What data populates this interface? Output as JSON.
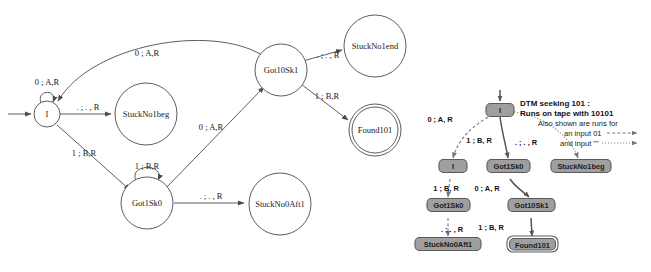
{
  "figure": {
    "background": "#ffffff"
  },
  "fsm": {
    "states": [
      {
        "id": "I",
        "label": "I",
        "cx": 47,
        "cy": 114,
        "r": 13,
        "accepting": false,
        "start": true
      },
      {
        "id": "StuckNo1beg",
        "label": "StuckNo1beg",
        "cx": 146,
        "cy": 114,
        "r": 31,
        "accepting": false,
        "start": false
      },
      {
        "id": "Got10Sk1",
        "label": "Got10Sk1",
        "cx": 281,
        "cy": 70,
        "r": 26,
        "accepting": false,
        "start": false
      },
      {
        "id": "StuckNo1end",
        "label": "StuckNo1end",
        "cx": 375,
        "cy": 46,
        "r": 31,
        "accepting": false,
        "start": false
      },
      {
        "id": "Found101",
        "label": "Found101",
        "cx": 375,
        "cy": 130,
        "r": 26,
        "accepting": true,
        "start": false
      },
      {
        "id": "Got1Sk0",
        "label": "Got1Sk0",
        "cx": 147,
        "cy": 203,
        "r": 26,
        "accepting": false,
        "start": false
      },
      {
        "id": "StuckNo0Aft1",
        "label": "StuckNo0Aft1",
        "cx": 280,
        "cy": 204,
        "r": 31,
        "accepting": false,
        "start": false
      }
    ],
    "transitions": [
      {
        "from": "I",
        "to": "I",
        "label": "0 ; A,R",
        "kind": "self",
        "lx": 47,
        "ly": 85
      },
      {
        "from": "I",
        "to": "StuckNo1beg",
        "label": ". ; . , R",
        "kind": "line",
        "lx": 88,
        "ly": 108
      },
      {
        "from": "I",
        "to": "Got1Sk0",
        "label": "1 ; B,R",
        "kind": "line",
        "lx": 84,
        "ly": 155
      },
      {
        "from": "Got10Sk1",
        "to": "I",
        "label": "0 ; A,R",
        "kind": "arc",
        "lx": 147,
        "ly": 56
      },
      {
        "from": "Got1Sk0",
        "to": "Got1Sk0",
        "label": "1 ; B,R",
        "kind": "self",
        "lx": 147,
        "ly": 168
      },
      {
        "from": "Got1Sk0",
        "to": "Got10Sk1",
        "label": "0 ; A,R",
        "kind": "line",
        "lx": 212,
        "ly": 129
      },
      {
        "from": "Got1Sk0",
        "to": "StuckNo0Aft1",
        "label": ". ; . , R",
        "kind": "line",
        "lx": 212,
        "ly": 198
      },
      {
        "from": "Got10Sk1",
        "to": "StuckNo1end",
        "label": ". ; . , R",
        "kind": "line",
        "lx": 329,
        "ly": 58
      },
      {
        "from": "Got10Sk1",
        "to": "Found101",
        "label": "1 ; B,R",
        "kind": "line",
        "lx": 330,
        "ly": 103
      }
    ]
  },
  "tree": {
    "note_lines": [
      {
        "text": "DTM seeking 101 :",
        "style": "bold",
        "x": 520,
        "y": 104
      },
      {
        "text": "Runs on tape with 10101",
        "style": "bold",
        "x": 520,
        "y": 114
      },
      {
        "text": "Also shown are runs for",
        "style": "reg",
        "x": 536,
        "y": 124
      },
      {
        "text": "an input 01",
        "style": "reg",
        "x": 561,
        "y": 134
      },
      {
        "text": "and input \"\"",
        "style": "reg",
        "x": 557,
        "y": 144
      }
    ],
    "legend": [
      {
        "for": "an input 01",
        "arrow": "dashed"
      },
      {
        "for": "and input \"\"",
        "arrow": "dotted"
      }
    ],
    "nodes": [
      {
        "id": "t-I-root",
        "label": "I",
        "x": 486,
        "y": 110,
        "w": 28,
        "h": 13,
        "accepting": false
      },
      {
        "id": "t-I-left",
        "label": "I",
        "x": 439,
        "y": 166,
        "w": 28,
        "h": 13,
        "accepting": false
      },
      {
        "id": "t-Got1Sk0-mid",
        "label": "Got1Sk0",
        "x": 487,
        "y": 166,
        "w": 41,
        "h": 13,
        "accepting": false
      },
      {
        "id": "t-StuckNo1beg",
        "label": "StuckNo1beg",
        "x": 553,
        "y": 166,
        "w": 57,
        "h": 13,
        "accepting": false
      },
      {
        "id": "t-Got1Sk0-left",
        "label": "Got1Sk0",
        "x": 428,
        "y": 205,
        "w": 41,
        "h": 13,
        "accepting": false
      },
      {
        "id": "t-Got10Sk1",
        "label": "Got10Sk1",
        "x": 508,
        "y": 205,
        "w": 45,
        "h": 13,
        "accepting": false
      },
      {
        "id": "t-StuckNo0Aft1",
        "label": "StuckNo0Aft1",
        "x": 418,
        "y": 244,
        "w": 61,
        "h": 13,
        "accepting": false
      },
      {
        "id": "t-Found101",
        "label": "Found101",
        "x": 510,
        "y": 244,
        "w": 44,
        "h": 13,
        "accepting": true
      }
    ],
    "edge_labels": [
      {
        "text": "0 ; A, R",
        "x": 440,
        "y": 122
      },
      {
        "text": "1 ; B, R",
        "x": 478,
        "y": 142
      },
      {
        "text": ". ; . , R",
        "x": 524,
        "y": 144
      },
      {
        "text": "1 ; B, R",
        "x": 444,
        "y": 190
      },
      {
        "text": "0 ; A, R",
        "x": 485,
        "y": 190
      },
      {
        "text": ". ; . , R",
        "x": 449,
        "y": 231
      },
      {
        "text": "1 ; B, R",
        "x": 489,
        "y": 229
      }
    ]
  },
  "colors": {
    "node_fill": "#9f9f9f",
    "node_stroke": "#5a5a5a",
    "edge_stroke": "#555555",
    "fsm_stroke": "#4c4c4c",
    "text": "#111111",
    "background": "#ffffff"
  }
}
